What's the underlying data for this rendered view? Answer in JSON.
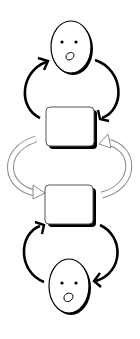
{
  "diagram": {
    "colors": {
      "stroke": "#000000",
      "fill": "#ffffff",
      "hollow_arrow_stroke": "#8a8a8a"
    },
    "nodes": [
      {
        "id": "face-top",
        "type": "face",
        "label": ""
      },
      {
        "id": "box-top",
        "type": "box",
        "label": ""
      },
      {
        "id": "box-bottom",
        "type": "box",
        "label": ""
      },
      {
        "id": "face-bottom",
        "type": "face",
        "label": ""
      }
    ],
    "edges": [
      {
        "from": "box-top",
        "to": "face-top",
        "style": "solid-curved",
        "side": "left"
      },
      {
        "from": "face-top",
        "to": "box-top",
        "style": "solid-curved",
        "side": "right"
      },
      {
        "from": "box-top",
        "to": "box-bottom",
        "style": "hollow-curved",
        "side": "left"
      },
      {
        "from": "box-bottom",
        "to": "box-top",
        "style": "hollow-curved",
        "side": "right"
      },
      {
        "from": "face-bottom",
        "to": "box-bottom",
        "style": "solid-curved",
        "side": "left"
      },
      {
        "from": "box-bottom",
        "to": "face-bottom",
        "style": "solid-curved",
        "side": "right"
      }
    ]
  }
}
